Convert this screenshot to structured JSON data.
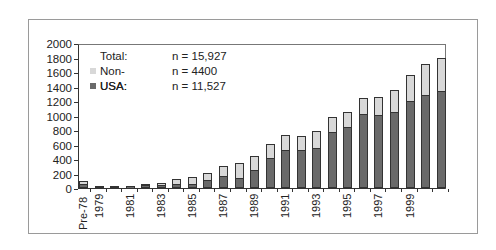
{
  "legend": {
    "rows": [
      {
        "label": "Total:",
        "value": "n = 15,927",
        "swatch": null
      },
      {
        "label": "Non-USA:",
        "value": "n = 4400",
        "swatch": "#d8d8d8"
      },
      {
        "label": "USA:",
        "value": "n = 11,527",
        "swatch": "#6a6a6a"
      }
    ]
  },
  "colors": {
    "usa": "#6a6a6a",
    "non_usa": "#d8d8d8",
    "axis": "#333333"
  },
  "chart_data": {
    "type": "bar",
    "stacked": true,
    "title": "",
    "xlabel": "",
    "ylabel": "",
    "ylim": [
      0,
      2000
    ],
    "yticks": [
      0,
      200,
      400,
      600,
      800,
      1000,
      1200,
      1400,
      1600,
      1800,
      2000
    ],
    "grid": false,
    "legend_position": "upper-left inside",
    "legend": [
      "Total: n = 15,927",
      "Non-USA: n = 4400",
      "USA: n = 11,527"
    ],
    "categories": [
      "Pre-78",
      "1979",
      "1980",
      "1981",
      "1982",
      "1983",
      "1984",
      "1985",
      "1986",
      "1987",
      "1988",
      "1989",
      "1990",
      "1991",
      "1992",
      "1993",
      "1994",
      "1995",
      "1996",
      "1997",
      "1998",
      "1999",
      "2000",
      "2001"
    ],
    "x_tick_labels_shown": [
      "Pre-78",
      "1979",
      "1981",
      "1983",
      "1985",
      "1987",
      "1989",
      "1991",
      "1993",
      "1995",
      "1997",
      "1999"
    ],
    "series": [
      {
        "name": "USA",
        "values": [
          40,
          10,
          10,
          30,
          30,
          30,
          35,
          40,
          100,
          150,
          125,
          240,
          400,
          515,
          505,
          540,
          755,
          825,
          1005,
          1000,
          1035,
          1190,
          1275,
          1330
        ]
      },
      {
        "name": "Non-USA",
        "values": [
          60,
          0,
          0,
          0,
          20,
          40,
          85,
          110,
          105,
          150,
          220,
          205,
          205,
          215,
          210,
          240,
          220,
          220,
          235,
          260,
          320,
          370,
          430,
          460
        ]
      }
    ],
    "totals": [
      100,
      10,
      10,
      30,
      50,
      70,
      120,
      150,
      205,
      300,
      345,
      445,
      605,
      730,
      715,
      780,
      975,
      1045,
      1240,
      1260,
      1355,
      1560,
      1705,
      1790
    ]
  }
}
